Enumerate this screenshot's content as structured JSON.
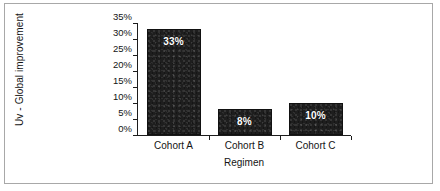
{
  "figure": {
    "background_color": "#ffffff",
    "frame_color": "#a8a8a8",
    "bar_color": "#1e1e1e",
    "label_color": "#ffffff",
    "axis_color": "#1c1c1c"
  },
  "chart_data": {
    "type": "bar",
    "title": "",
    "subtitle": "",
    "xlabel": "Regimen",
    "ylabel": "Uv - Global improvement",
    "categories": [
      "Cohort A",
      "Cohort B",
      "Cohort C"
    ],
    "values": [
      33,
      8,
      10
    ],
    "data_labels": [
      "33%",
      "8%",
      "10%"
    ],
    "ylim": [
      0,
      35
    ],
    "ytick_values": [
      0,
      5,
      10,
      15,
      20,
      25,
      30,
      35
    ],
    "ytick_labels": [
      "0%",
      "5%",
      "10%",
      "15%",
      "20%",
      "25%",
      "30%",
      "35%"
    ],
    "grid": false,
    "legend": false,
    "legend_position": "none",
    "orientation": "vertical",
    "value_unit": "%"
  }
}
